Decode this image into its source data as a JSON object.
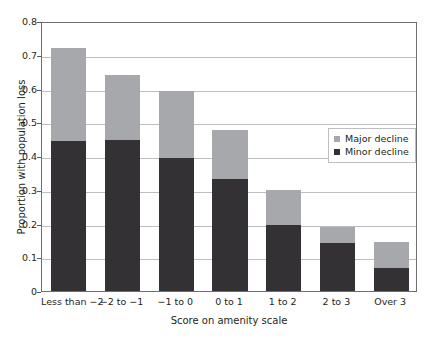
{
  "chart_data": {
    "type": "bar",
    "subtype": "stacked-vertical",
    "title": "",
    "xlabel": "Score on amenity scale",
    "ylabel": "Proportion with population loss",
    "categories": [
      "Less than −2",
      "−2 to −1",
      "−1 to 0",
      "0 to 1",
      "1 to 2",
      "2 to 3",
      "Over 3"
    ],
    "series": [
      {
        "name": "Minor decline",
        "color": "#333133",
        "values": [
          0.445,
          0.446,
          0.394,
          0.331,
          0.196,
          0.141,
          0.067
        ]
      },
      {
        "name": "Major decline",
        "color": "#a6a8ab",
        "values": [
          0.276,
          0.194,
          0.199,
          0.146,
          0.104,
          0.049,
          0.078
        ]
      }
    ],
    "totals": [
      0.721,
      0.64,
      0.593,
      0.477,
      0.3,
      0.19,
      0.145
    ],
    "ylim": [
      0,
      0.8
    ],
    "yticks": [
      0,
      0.1,
      0.2,
      0.3,
      0.4,
      0.5,
      0.6,
      0.7,
      0.8
    ],
    "ytick_labels": [
      "0",
      "0.1",
      "0.2",
      "0.3",
      "0.4",
      "0.5",
      "0.6",
      "0.7",
      "0.8"
    ],
    "grid": "horizontal",
    "legend_position": "center-right",
    "legend_entries": [
      "Major decline",
      "Minor decline"
    ]
  },
  "legend": {
    "items": [
      {
        "label": "Major decline",
        "color": "#a6a8ab"
      },
      {
        "label": "Minor decline",
        "color": "#333133"
      }
    ]
  },
  "axes": {
    "y_title": "Proportion with population loss",
    "x_title": "Score on amenity scale"
  },
  "colors": {
    "major": "#a6a8ab",
    "minor": "#333133",
    "gridline": "#bcbec0",
    "frame": "#6d6e71",
    "text": "#231f20",
    "background": "#ffffff"
  }
}
